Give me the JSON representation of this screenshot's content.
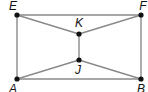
{
  "diagram": {
    "type": "geometric-figure",
    "points": [
      {
        "id": "E",
        "label": "E",
        "x": 17,
        "y": 15,
        "lx": 13,
        "ly": 10
      },
      {
        "id": "F",
        "label": "F",
        "x": 141,
        "y": 15,
        "lx": 143,
        "ly": 10
      },
      {
        "id": "A",
        "label": "A",
        "x": 17,
        "y": 79,
        "lx": 13,
        "ly": 93
      },
      {
        "id": "B",
        "label": "B",
        "x": 141,
        "y": 79,
        "lx": 141,
        "ly": 93
      },
      {
        "id": "K",
        "label": "K",
        "x": 79,
        "y": 34,
        "lx": 79,
        "ly": 27
      },
      {
        "id": "J",
        "label": "J",
        "x": 79,
        "y": 60,
        "lx": 78,
        "ly": 74
      }
    ],
    "segments": [
      [
        "E",
        "F"
      ],
      [
        "F",
        "B"
      ],
      [
        "B",
        "A"
      ],
      [
        "A",
        "E"
      ],
      [
        "E",
        "K"
      ],
      [
        "F",
        "K"
      ],
      [
        "K",
        "J"
      ],
      [
        "A",
        "J"
      ],
      [
        "B",
        "J"
      ]
    ],
    "colors": {
      "line": "#8a8a8a",
      "point": "#111111",
      "label": "#111111"
    }
  }
}
